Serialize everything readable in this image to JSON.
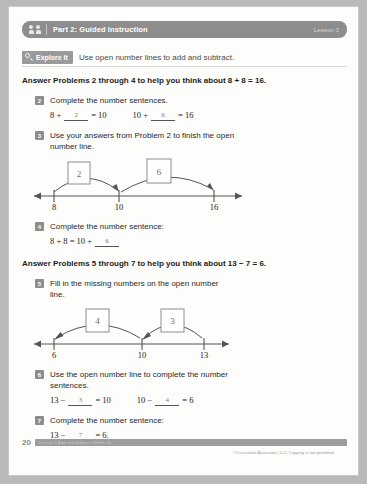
{
  "header": {
    "title": "Part 2: Guided Instruction",
    "lesson": "Lesson 3",
    "people_icon": "people-icon"
  },
  "explore": {
    "label": "Explore It",
    "icon": "magnifier-icon",
    "description": "Use open number lines to add and subtract."
  },
  "sections": [
    {
      "prompt": "Answer Problems 2 through 4 to help you think about 8 + 8 = 16.",
      "problems": [
        {
          "number": "2",
          "text": "Complete the number sentences.",
          "sentences": [
            {
              "left": "8 +",
              "answer": "2",
              "right": "= 10"
            },
            {
              "left": "10 +",
              "answer": "6",
              "right": "= 16"
            }
          ]
        },
        {
          "number": "3",
          "text": "Use your answers from Problem 2 to finish the open number line."
        },
        {
          "number": "4",
          "text": "Complete the number sentence:",
          "sentences": [
            {
              "left": "8 + 8 = 10 +",
              "answer": "6",
              "right": ""
            }
          ]
        }
      ],
      "numberline": {
        "ticks": [
          "8",
          "10",
          "16"
        ],
        "jumps": [
          "2",
          "6"
        ],
        "direction": "right"
      }
    },
    {
      "prompt": "Answer Problems 5 through 7 to help you think about 13 − 7 = 6.",
      "problems": [
        {
          "number": "5",
          "text": "Fill in the missing numbers on the open number line."
        },
        {
          "number": "6",
          "text": "Use the open number line to complete the number sentences.",
          "sentences": [
            {
              "left": "13 −",
              "answer": "3",
              "right": "= 10"
            },
            {
              "left": "10 −",
              "answer": "4",
              "right": "= 6"
            }
          ]
        },
        {
          "number": "7",
          "text": "Complete the number sentence:",
          "sentences": [
            {
              "left": "13 −",
              "answer": "7",
              "right": "= 6."
            }
          ]
        }
      ],
      "numberline": {
        "ticks": [
          "6",
          "10",
          "13"
        ],
        "jumps": [
          "4",
          "3"
        ],
        "direction": "left"
      }
    }
  ],
  "footer": {
    "page_number": "20",
    "bar_text": "Lesson 3  Add and Subtract Within 20",
    "copyright": "©Curriculum Associates, LLC   Copying is not permitted."
  }
}
